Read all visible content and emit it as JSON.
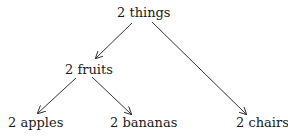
{
  "diagram": {
    "type": "tree",
    "nodes": {
      "root": {
        "label": "2 things"
      },
      "fruits": {
        "label": "2 fruits"
      },
      "apples": {
        "label": "2 apples"
      },
      "bananas": {
        "label": "2 bananas"
      },
      "chairs": {
        "label": "2 chairs"
      }
    },
    "edges": [
      {
        "from": "2 things",
        "to": "2 fruits"
      },
      {
        "from": "2 things",
        "to": "2 chairs"
      },
      {
        "from": "2 fruits",
        "to": "2 apples"
      },
      {
        "from": "2 fruits",
        "to": "2 bananas"
      }
    ],
    "colors": {
      "text": "#1a1a1a",
      "edge": "#333333",
      "background": "#ffffff"
    }
  }
}
